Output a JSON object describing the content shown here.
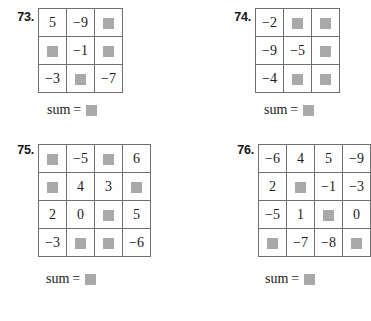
{
  "worksheet": {
    "blank_symbol": "blank-square",
    "blank_color": "#a9a9a9",
    "grid_line_color": "#6f6f6f",
    "background_color": "#ffffff",
    "sum_label": "sum",
    "equals_sign": "="
  },
  "problems": [
    {
      "number": "73.",
      "rows": 3,
      "cols": 3,
      "cells": [
        [
          "5",
          "−9",
          ""
        ],
        [
          "",
          "−1",
          ""
        ],
        [
          "−3",
          "",
          "−7"
        ]
      ],
      "sum_label": "sum",
      "equals": "=",
      "sum_value": ""
    },
    {
      "number": "74.",
      "rows": 3,
      "cols": 3,
      "cells": [
        [
          "−2",
          "",
          ""
        ],
        [
          "−9",
          "−5",
          ""
        ],
        [
          "−4",
          "",
          ""
        ]
      ],
      "sum_label": "sum",
      "equals": "=",
      "sum_value": ""
    },
    {
      "number": "75.",
      "rows": 4,
      "cols": 4,
      "cells": [
        [
          "",
          "−5",
          "",
          "6"
        ],
        [
          "",
          "4",
          "3",
          ""
        ],
        [
          "2",
          "0",
          "",
          "5"
        ],
        [
          "−3",
          "",
          "",
          "−6"
        ]
      ],
      "sum_label": "sum",
      "equals": "=",
      "sum_value": ""
    },
    {
      "number": "76.",
      "rows": 4,
      "cols": 4,
      "cells": [
        [
          "−6",
          "4",
          "5",
          "−9"
        ],
        [
          "2",
          "",
          "−1",
          "−3"
        ],
        [
          "−5",
          "1",
          "",
          "0"
        ],
        [
          "",
          "−7",
          "−8",
          ""
        ]
      ],
      "sum_label": "sum",
      "equals": "=",
      "sum_value": ""
    }
  ]
}
